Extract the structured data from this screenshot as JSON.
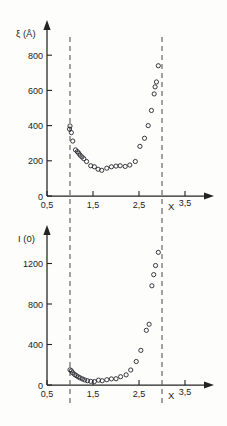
{
  "figure": {
    "background_color": "#fdfdfb",
    "ink_color": "#232323",
    "marker_color": "#23232b",
    "dash_color": "#5a5a5a"
  },
  "chart_data": [
    {
      "type": "scatter",
      "panel": "top",
      "title": "",
      "xlabel": "X",
      "ylabel": "ξ (Å)",
      "xlim": [
        0.32,
        3.78
      ],
      "ylim": [
        0,
        900
      ],
      "grid": false,
      "legend": null,
      "xticks": [
        0.5,
        1.5,
        2.5,
        3.5
      ],
      "xticklabels": [
        "0,5",
        "1,5",
        "2,5",
        "3,5"
      ],
      "yticks": [
        0,
        200,
        400,
        600,
        800
      ],
      "yticklabels": [
        "0",
        "200",
        "400",
        "600",
        "800"
      ],
      "annotations": [
        {
          "type": "vline",
          "x": 1.0,
          "style": "dashed"
        },
        {
          "type": "vline",
          "x": 3.0,
          "style": "dashed"
        }
      ],
      "x": [
        0.99,
        1.0,
        1.03,
        1.06,
        1.12,
        1.16,
        1.19,
        1.22,
        1.26,
        1.3,
        1.36,
        1.45,
        1.53,
        1.61,
        1.69,
        1.8,
        1.9,
        2.0,
        2.09,
        2.2,
        2.3,
        2.42,
        2.52,
        2.62,
        2.7,
        2.77,
        2.83,
        2.85,
        2.88,
        2.92
      ],
      "y": [
        380,
        398,
        360,
        312,
        262,
        252,
        243,
        232,
        222,
        212,
        196,
        172,
        166,
        152,
        146,
        158,
        166,
        170,
        172,
        168,
        176,
        196,
        282,
        328,
        400,
        486,
        580,
        620,
        648,
        740
      ],
      "xlabel_units": "",
      "ylabel_units": "Å"
    },
    {
      "type": "scatter",
      "panel": "bottom",
      "title": "",
      "xlabel": "X",
      "ylabel": "I (0)",
      "xlim": [
        0.32,
        3.78
      ],
      "ylim": [
        0,
        1450
      ],
      "grid": false,
      "legend": null,
      "xticks": [
        0.5,
        1.5,
        2.5,
        3.5
      ],
      "xticklabels": [
        "0,5",
        "1,5",
        "2,5",
        "3,5"
      ],
      "yticks": [
        0,
        400,
        800,
        1200
      ],
      "yticklabels": [
        "0",
        "400",
        "800",
        "1200"
      ],
      "annotations": [
        {
          "type": "vline",
          "x": 1.0,
          "style": "dashed"
        },
        {
          "type": "vline",
          "x": 3.0,
          "style": "dashed"
        }
      ],
      "x": [
        1.0,
        1.03,
        1.06,
        1.1,
        1.14,
        1.18,
        1.22,
        1.27,
        1.32,
        1.38,
        1.45,
        1.53,
        1.62,
        1.7,
        1.8,
        1.9,
        2.0,
        2.1,
        2.22,
        2.32,
        2.44,
        2.54,
        2.66,
        2.72,
        2.78,
        2.82,
        2.86,
        2.92
      ],
      "y": [
        150,
        140,
        120,
        104,
        92,
        80,
        70,
        60,
        50,
        42,
        36,
        34,
        48,
        42,
        52,
        60,
        62,
        82,
        100,
        148,
        232,
        342,
        540,
        600,
        980,
        1090,
        1180,
        1310
      ]
    }
  ]
}
